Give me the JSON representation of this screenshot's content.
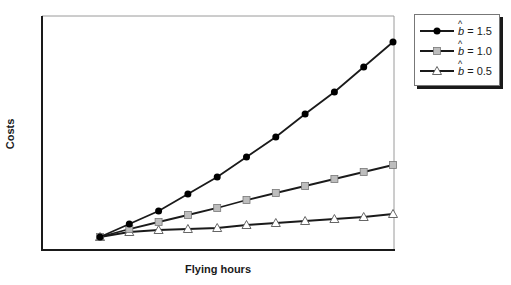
{
  "chart_data": {
    "type": "line",
    "title": "",
    "xlabel": "Flying hours",
    "ylabel": "Costs",
    "x": [
      0,
      1,
      2,
      3,
      4,
      5,
      6,
      7,
      8,
      9,
      10
    ],
    "xticks_visible": false,
    "yticks_visible": false,
    "grid": false,
    "ylim": [
      0,
      200
    ],
    "legend_position": "upper-right-outside",
    "series": [
      {
        "name": "b̂ = 1.5",
        "label_var": "b",
        "label_value": "= 1.5",
        "marker": "circle",
        "marker_fill": "#000000",
        "values": [
          0,
          13,
          26,
          43,
          60,
          80,
          100,
          123,
          145,
          170,
          195
        ]
      },
      {
        "name": "b̂ = 1.0",
        "label_var": "b",
        "label_value": "= 1.0",
        "marker": "square",
        "marker_fill": "#bdbdbd",
        "values": [
          0,
          8,
          15,
          22,
          29,
          37,
          44,
          51,
          58,
          65,
          72
        ]
      },
      {
        "name": "b̂ = 0.5",
        "label_var": "b",
        "label_value": "= 0.5",
        "marker": "triangle",
        "marker_fill": "#ffffff",
        "values": [
          0,
          5,
          7,
          8,
          9,
          12,
          14,
          16,
          18,
          20,
          23
        ]
      }
    ]
  },
  "axes": {
    "x_label": "Flying hours",
    "y_label": "Costs"
  },
  "legend": {
    "items": [
      {
        "var": "b",
        "value": "= 1.5"
      },
      {
        "var": "b",
        "value": "= 1.0"
      },
      {
        "var": "b",
        "value": "= 0.5"
      }
    ]
  },
  "colors": {
    "line": "#1a1a1a",
    "axis": "#1a1a1a",
    "frame": "#9a9a9a",
    "square_fill": "#bdbdbd",
    "circle_fill": "#000000",
    "triangle_fill": "#ffffff"
  }
}
